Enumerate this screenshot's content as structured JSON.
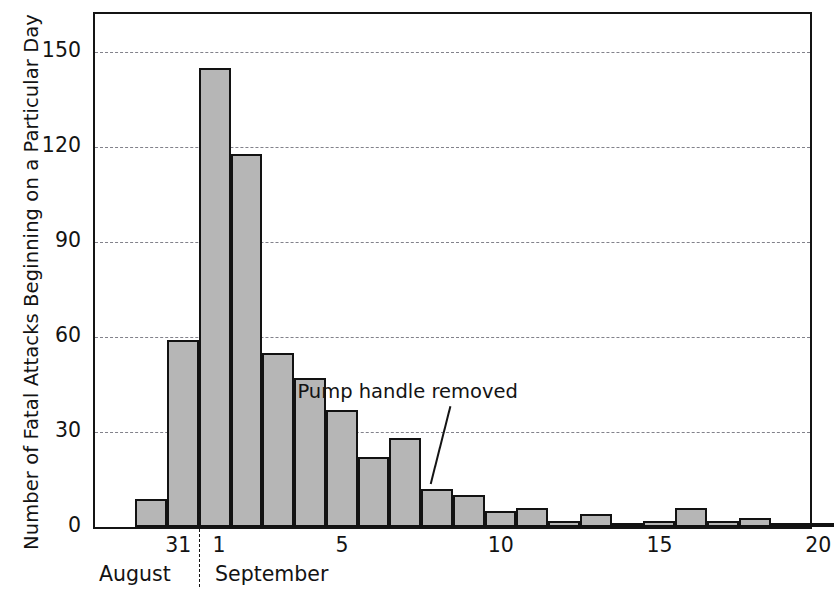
{
  "chart_data": {
    "type": "bar",
    "title": "",
    "xlabel": "",
    "ylabel": "Number of Fatal Attacks Beginning on a Particular Day",
    "ylim": [
      0,
      162
    ],
    "yticks": [
      0,
      30,
      60,
      90,
      120,
      150
    ],
    "ytick_labels": [
      "0",
      "30",
      "60",
      "90",
      "120",
      "150"
    ],
    "grid": true,
    "legend": null,
    "categories": [
      "August 30",
      "August 31",
      "September 1",
      "September 2",
      "September 3",
      "September 4",
      "September 5",
      "September 6",
      "September 7",
      "September 8",
      "September 9",
      "September 10",
      "September 11",
      "September 12",
      "September 13",
      "September 14",
      "September 15",
      "September 16",
      "September 17",
      "September 18",
      "September 19",
      "September 20"
    ],
    "x": [
      30,
      31,
      1,
      2,
      3,
      4,
      5,
      6,
      7,
      8,
      9,
      10,
      11,
      12,
      13,
      14,
      15,
      16,
      17,
      18,
      19,
      20
    ],
    "values": [
      9,
      59,
      145,
      118,
      55,
      47,
      37,
      22,
      28,
      12,
      10,
      5,
      6,
      2,
      4,
      1,
      2,
      6,
      2,
      3,
      1,
      1
    ],
    "xtick_values": [
      31,
      1,
      5,
      10,
      15,
      20
    ],
    "xtick_labels": [
      "31",
      "1",
      "5",
      "10",
      "15",
      "20"
    ],
    "month_labels": [
      "August",
      "September"
    ],
    "month_divider_at": "between August 31 and September 1",
    "annotations": [
      {
        "text": "Pump handle removed",
        "points_to": "September 8",
        "leader_line": true
      }
    ],
    "bar_fill_color": "#b6b6b6",
    "bar_edge_color": "#121212",
    "gridline_color": "#6d6d77",
    "axis_color": "#141414",
    "background_color": "#ffffff"
  },
  "axis": {
    "y_title": "Number of Fatal Attacks Beginning on a Particular Day"
  },
  "annotation": {
    "pump_handle": "Pump handle removed"
  },
  "months": {
    "august": "August",
    "september": "September"
  }
}
